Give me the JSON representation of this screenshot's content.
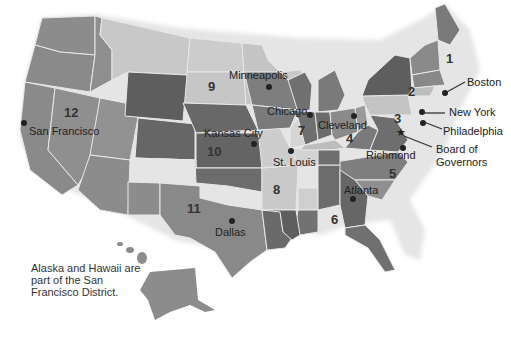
{
  "map": {
    "title": "Federal Reserve Districts",
    "colors": {
      "light": "#c8c8c8",
      "lighter": "#d6d6d6",
      "mid": "#8c8c8c",
      "dark": "#6a6a6a",
      "darker": "#5c5c5c",
      "border": "#eeeeee"
    },
    "districts": [
      {
        "number": "1",
        "city": "Boston"
      },
      {
        "number": "2",
        "city": "New York"
      },
      {
        "number": "3",
        "city": "Philadelphia"
      },
      {
        "number": "4",
        "city": "Cleveland"
      },
      {
        "number": "5",
        "city": "Richmond"
      },
      {
        "number": "6",
        "city": "Atlanta"
      },
      {
        "number": "7",
        "city": "Chicago"
      },
      {
        "number": "8",
        "city": "St. Louis"
      },
      {
        "number": "9",
        "city": "Minneapolis"
      },
      {
        "number": "10",
        "city": "Kansas City"
      },
      {
        "number": "11",
        "city": "Dallas"
      },
      {
        "number": "12",
        "city": "San Francisco"
      }
    ],
    "extra_labels": {
      "board": "Board of\nGovernors",
      "board_line1": "Board of",
      "board_line2": "Governors"
    },
    "note": "Alaska and Hawaii are part of the San Francisco District."
  }
}
